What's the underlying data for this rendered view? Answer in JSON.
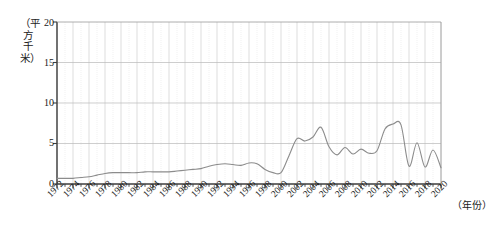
{
  "chart_data": {
    "type": "line",
    "title": "",
    "xlabel": "（年份）",
    "ylabel": "（平方千米）",
    "ylim": [
      0,
      20
    ],
    "xlim": [
      1972,
      2020
    ],
    "yticks": [
      0,
      5,
      10,
      15,
      20
    ],
    "xticks": [
      1972,
      1974,
      1976,
      1978,
      1980,
      1982,
      1984,
      1986,
      1988,
      1990,
      1992,
      1994,
      1996,
      1998,
      2000,
      2002,
      2004,
      2006,
      2008,
      2010,
      2012,
      2014,
      2016,
      2018,
      2020
    ],
    "grid": "both",
    "legend": "none",
    "line_color": "#8c8c8c",
    "grid_color": "#d8d8d8",
    "axis_color": "#4d4d4d",
    "x": [
      1972,
      1973,
      1974,
      1975,
      1976,
      1977,
      1978,
      1979,
      1980,
      1981,
      1982,
      1983,
      1984,
      1985,
      1986,
      1987,
      1988,
      1989,
      1990,
      1991,
      1992,
      1993,
      1994,
      1995,
      1996,
      1997,
      1998,
      1999,
      2000,
      2001,
      2002,
      2003,
      2004,
      2005,
      2006,
      2007,
      2008,
      2009,
      2010,
      2011,
      2012,
      2013,
      2014,
      2015,
      2016,
      2017,
      2018,
      2019,
      2020
    ],
    "values": [
      0.7,
      0.7,
      0.7,
      0.8,
      0.9,
      1.1,
      1.3,
      1.4,
      1.4,
      1.4,
      1.4,
      1.5,
      1.5,
      1.5,
      1.5,
      1.6,
      1.7,
      1.8,
      1.9,
      2.2,
      2.4,
      2.5,
      2.4,
      2.3,
      2.6,
      2.5,
      1.8,
      1.4,
      1.4,
      3.5,
      5.6,
      5.3,
      5.8,
      7.0,
      4.6,
      3.6,
      4.5,
      3.7,
      4.3,
      3.8,
      4.1,
      6.8,
      7.4,
      7.3,
      2.2,
      5.1,
      2.1,
      4.2,
      2.0
    ],
    "series_name": "面积",
    "units": "平方千米"
  },
  "axis": {
    "y_title": "（平方千米）",
    "x_title": "（年份）",
    "y_labels": [
      "20",
      "15",
      "10",
      "5",
      "0"
    ]
  }
}
